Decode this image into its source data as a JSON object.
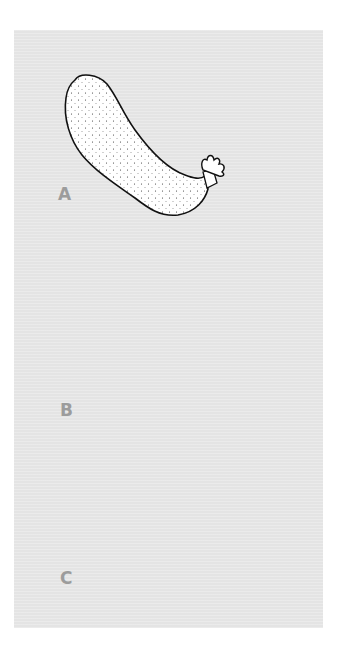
{
  "figure": {
    "background_color": "#e4e4e4",
    "label_color": "#9c9c9c",
    "panels": [
      {
        "label": "A",
        "subject": "elongated stippled body with crown of tentacles"
      },
      {
        "label": "B",
        "subject": "bulbous stippled body with curved neck and feathery tentacles"
      },
      {
        "label": "C",
        "subject": "ribbed body with narrow tubular extension"
      }
    ]
  }
}
